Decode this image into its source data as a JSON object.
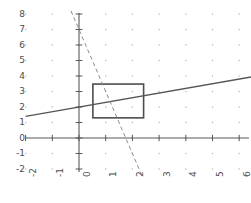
{
  "chart_data": {
    "type": "line",
    "title": "",
    "xlabel": "",
    "ylabel": "",
    "xlim": [
      -2,
      6.5
    ],
    "ylim": [
      -2.4,
      8.3
    ],
    "grid": "dotted-points-at-integer-lattice",
    "legend": "none",
    "x_ticks": [
      -2,
      -1,
      0,
      1,
      2,
      3,
      4,
      5,
      6
    ],
    "x_tick_labels": [
      "-2",
      "-1",
      "0",
      "1",
      "2",
      "3",
      "4",
      "5",
      "6"
    ],
    "y_ticks": [
      -2,
      -1,
      0,
      1,
      2,
      3,
      4,
      5,
      6,
      7,
      8
    ],
    "y_tick_labels": [
      "-2",
      "-1",
      "0",
      "1",
      "2",
      "3",
      "4",
      "5",
      "6",
      "7",
      "8"
    ],
    "x_tick_label_rotation": -90,
    "series": [
      {
        "name": "solid-line",
        "style": "solid",
        "color": "#555555",
        "equation": "y = 0.3x + 2",
        "slope": 0.3,
        "intercept": 2,
        "x": [
          -2,
          6.45
        ],
        "values": [
          1.4,
          3.94
        ]
      },
      {
        "name": "dashed-line",
        "style": "dashed",
        "color": "#808080",
        "equation": "y = -4x + 7",
        "slope": -4,
        "intercept": 7,
        "x": [
          -0.3,
          2.35
        ],
        "values": [
          8.2,
          -2.4
        ]
      }
    ],
    "shapes": [
      {
        "name": "rectangle",
        "type": "rect",
        "x0": 0.52,
        "y0": 1.3,
        "x1": 2.42,
        "y1": 3.48,
        "stroke": "#4d4d4d",
        "fill": "none"
      }
    ],
    "axes": {
      "x_axis_at_y": 0,
      "y_axis_at_x": 0,
      "axis_color": "#595959"
    }
  },
  "colors": {
    "background": "#ffffff",
    "axis": "#595959",
    "grid_dot": "#b3b3b3",
    "solid_line": "#555555",
    "dashed_line": "#8c8c8c",
    "rect_stroke": "#4d4d4d",
    "tick_text": "#4d4d4d"
  }
}
